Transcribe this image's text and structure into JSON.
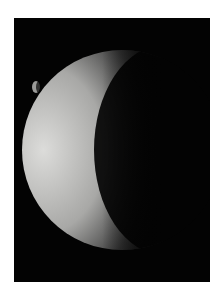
{
  "image": {
    "subject": "crescent planet with small moon",
    "background_color": "#030303",
    "border_color": "#ffffff",
    "crescent_light_color": "#d8d8d6",
    "moon_color": "#9a9a98"
  }
}
